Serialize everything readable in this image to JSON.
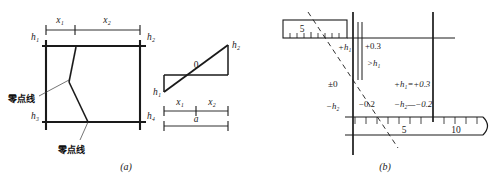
{
  "figure": {
    "title": "",
    "panels": [
      {
        "caption": "(a)",
        "left_diagram": {
          "top_dim_labels": [
            "x₁",
            "x₂"
          ],
          "corner_labels": {
            "top_left": "h₁",
            "top_right": "h₂",
            "bottom_left": "h₃",
            "bottom_right": "h₄"
          },
          "annotations": [
            {
              "text": "零点线",
              "position": "upper-left"
            },
            {
              "text": "零点线",
              "position": "lower-center"
            }
          ]
        },
        "right_diagram": {
          "zero_label": "0",
          "left_label": "h₁",
          "right_label": "h₂",
          "dim_labels": [
            "x₁",
            "x₂"
          ],
          "total_dim_label": "a"
        }
      },
      {
        "caption": "(b)",
        "labels": {
          "top_scale_value": "5",
          "plus_h1": "+h₁",
          "plus_value": "+0.3",
          "greater_than_h1": ">h₁",
          "zero_ref": "±0",
          "minus_h2": "−h₂",
          "minus_value": "−0.2",
          "equation_plus": "+h₁=+0.3",
          "equation_minus": "−h₂—−0.2"
        },
        "bottom_scale": {
          "tick_labels": [
            "5",
            "10"
          ],
          "tick_count": 13
        }
      }
    ],
    "colors": {
      "line": "#1a1a1a",
      "background": "#ffffff",
      "thin_line": "#2b2b2b"
    }
  }
}
